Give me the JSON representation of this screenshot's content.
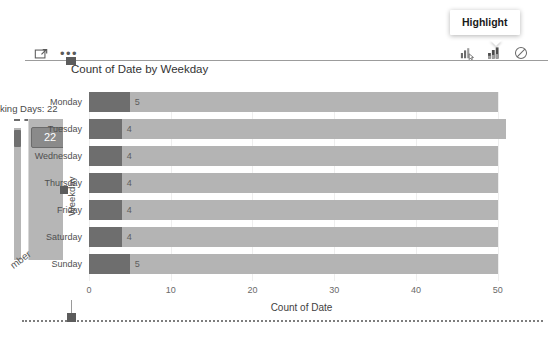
{
  "tooltip": {
    "label": "Highlight"
  },
  "toolbar": {
    "left": [
      {
        "name": "focus-mode-icon",
        "label": "Focus mode"
      },
      {
        "name": "more-options-icon",
        "label": "..."
      }
    ],
    "right": [
      {
        "name": "filter-mode-icon",
        "label": "Filter"
      },
      {
        "name": "highlight-mode-icon",
        "label": "Highlight"
      },
      {
        "name": "no-interaction-icon",
        "label": "None"
      }
    ]
  },
  "left_visual": {
    "title": "king Days: 22",
    "data_label": "22",
    "category_label": "mber"
  },
  "chart_data": {
    "type": "bar",
    "orientation": "horizontal",
    "title": "Count of Date by Weekday",
    "xlabel": "Count of Date",
    "ylabel": "Weekday",
    "categories": [
      "Monday",
      "Tuesday",
      "Wednesday",
      "Thursday",
      "Friday",
      "Saturday",
      "Sunday"
    ],
    "series": [
      {
        "name": "Count of Date",
        "values": [
          50,
          51,
          50,
          50,
          50,
          50,
          50
        ]
      },
      {
        "name": "Highlighted",
        "values": [
          5,
          4,
          4,
          4,
          4,
          4,
          5
        ]
      }
    ],
    "data_labels": [
      "5",
      "4",
      "4",
      "4",
      "4",
      "4",
      "5"
    ],
    "xticks": [
      "0",
      "10",
      "20",
      "30",
      "40",
      "50"
    ],
    "xlim": [
      0,
      52
    ],
    "grid": true,
    "legend": "none",
    "colors": {
      "total": "#b4b4b4",
      "highlight": "#6e6e6e"
    }
  }
}
